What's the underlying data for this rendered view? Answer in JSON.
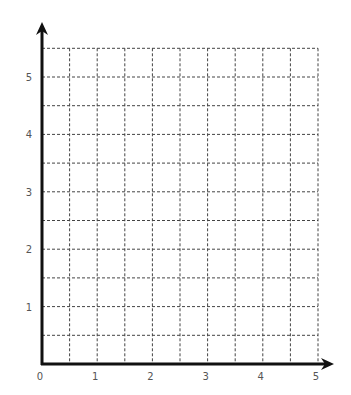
{
  "chart_data": {
    "type": "scatter",
    "title": "",
    "xlabel": "",
    "ylabel": "",
    "xlim": [
      0,
      5
    ],
    "ylim": [
      0,
      5.5
    ],
    "x_ticks": [
      "0",
      "1",
      "2",
      "3",
      "4",
      "5"
    ],
    "y_ticks": [
      "1",
      "2",
      "3",
      "4",
      "5"
    ],
    "grid": true,
    "grid_style": "dashed",
    "grid_step": 0.5,
    "series": [],
    "legend": null
  },
  "colors": {
    "axis": "#111111",
    "grid": "#444444",
    "tick_label": "#555555",
    "background": "#ffffff"
  }
}
